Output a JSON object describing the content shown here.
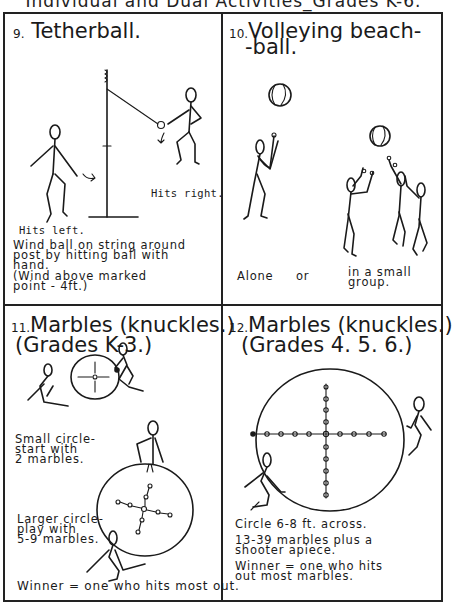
{
  "page": {
    "header_title": "Individual and Dual Activities_Grades K-6."
  },
  "panels": [
    {
      "number": "9.",
      "title": "Tetherball.",
      "labels": {
        "hits_right": "Hits right.",
        "hits_left": "Hits left."
      },
      "description": [
        "Wind ball on string around",
        "post by hitting ball with",
        "hand.",
        "(Wind above marked",
        " point - 4ft.)"
      ]
    },
    {
      "number": "10.",
      "title_line1": "Volleying beach-",
      "title_line2": "-ball.",
      "labels": {
        "alone": "Alone",
        "or": "or",
        "group_line1": "in a small",
        "group_line2": "group."
      }
    },
    {
      "number": "11.",
      "title_line1": "Marbles (knuckles.)",
      "title_line2": "(Grades K-3.)",
      "labels": {
        "small_circle": [
          "Small circle-",
          "start with",
          "2 marbles."
        ],
        "larger_circle": [
          "Larger circle-",
          "play with",
          "5-9 marbles."
        ]
      },
      "footer": "Winner = one who hits most out."
    },
    {
      "number": "12.",
      "title_line1": "Marbles (knuckles.)",
      "title_line2": "(Grades 4. 5. 6.)",
      "notes": [
        "Circle 6-8 ft. across.",
        "13-39 marbles plus a",
        "shooter apiece.",
        "Winner = one who hits",
        "out most marbles."
      ]
    }
  ]
}
